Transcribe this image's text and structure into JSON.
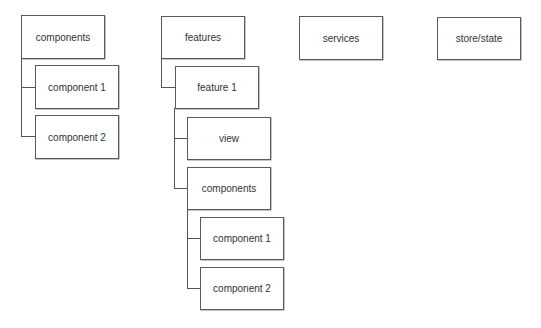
{
  "diagram": {
    "type": "folder-structure",
    "nodes": {
      "components": {
        "label": "components"
      },
      "components_component1": {
        "label": "component 1"
      },
      "components_component2": {
        "label": "component 2"
      },
      "features": {
        "label": "features"
      },
      "feature1": {
        "label": "feature 1"
      },
      "feature1_view": {
        "label": "view"
      },
      "feature1_components": {
        "label": "components"
      },
      "feature1_components_component1": {
        "label": "component 1"
      },
      "feature1_components_component2": {
        "label": "component 2"
      },
      "services": {
        "label": "services"
      },
      "store_state": {
        "label": "store/state"
      }
    },
    "edges": [
      {
        "from": "components",
        "to": "components_component1"
      },
      {
        "from": "components",
        "to": "components_component2"
      },
      {
        "from": "features",
        "to": "feature1"
      },
      {
        "from": "feature1",
        "to": "feature1_view"
      },
      {
        "from": "feature1",
        "to": "feature1_components"
      },
      {
        "from": "feature1_components",
        "to": "feature1_components_component1"
      },
      {
        "from": "feature1_components",
        "to": "feature1_components_component2"
      }
    ]
  }
}
